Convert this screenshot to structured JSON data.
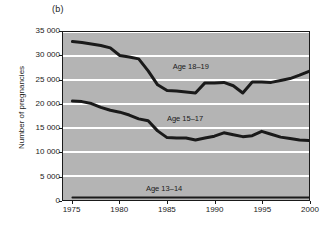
{
  "figure": {
    "panel_label": "(b)"
  },
  "axes": {
    "ylabel": "Number of pregnancies",
    "xlabel": "",
    "yticks": [
      "0",
      "5 000",
      "10 000",
      "15 000",
      "20 000",
      "25 000",
      "30 000",
      "35 000"
    ],
    "ytick_values": [
      0,
      5000,
      10000,
      15000,
      20000,
      25000,
      30000,
      35000
    ],
    "xticks": [
      "1975",
      "1980",
      "1985",
      "1990",
      "1995",
      "2000"
    ],
    "xtick_values": [
      1975,
      1980,
      1985,
      1990,
      1995,
      2000
    ]
  },
  "colors": {
    "plot_background": "#b4b4b4",
    "gridline": "#ffffff",
    "line": "#1a1a1a",
    "frame": "#1a1a1a",
    "text": "#1a1a1a"
  },
  "series_labels": [
    {
      "text": "Age 18–19",
      "x": 1987.4,
      "y": 27800
    },
    {
      "text": "Age 15–17",
      "x": 1986.8,
      "y": 17100
    },
    {
      "text": "Age 13–14",
      "x": 1984.6,
      "y": 2600
    }
  ],
  "chart_data": {
    "type": "line",
    "title": "",
    "subtitle": "",
    "xlabel": "",
    "ylabel": "Number of pregnancies",
    "xlim": [
      1974,
      2000
    ],
    "ylim": [
      0,
      35000
    ],
    "grid": "horizontal",
    "legend": "inline-labels",
    "x": [
      1975,
      1976,
      1977,
      1978,
      1979,
      1980,
      1981,
      1982,
      1983,
      1984,
      1985,
      1986,
      1987,
      1988,
      1989,
      1990,
      1991,
      1992,
      1993,
      1994,
      1995,
      1996,
      1997,
      1998,
      1999,
      2000
    ],
    "series": [
      {
        "name": "Age 18–19",
        "values": [
          33000,
          32800,
          32500,
          32200,
          31700,
          30100,
          29800,
          29400,
          26900,
          24000,
          22800,
          22700,
          22500,
          22300,
          24400,
          24400,
          24500,
          23800,
          22300,
          24600,
          24600,
          24500,
          24900,
          25300,
          26000,
          26800
        ]
      },
      {
        "name": "Age 15–17",
        "values": [
          20600,
          20500,
          20100,
          19300,
          18700,
          18300,
          17700,
          16900,
          16500,
          14400,
          13000,
          12900,
          12900,
          12500,
          12900,
          13300,
          14000,
          13600,
          13200,
          13400,
          14300,
          13700,
          13100,
          12800,
          12500,
          12400
        ]
      },
      {
        "name": "Age 13–14",
        "values": [
          500,
          500,
          500,
          500,
          500,
          500,
          500,
          500,
          500,
          500,
          500,
          500,
          500,
          500,
          500,
          500,
          500,
          500,
          500,
          500,
          500,
          500,
          500,
          500,
          500,
          500
        ]
      }
    ]
  }
}
